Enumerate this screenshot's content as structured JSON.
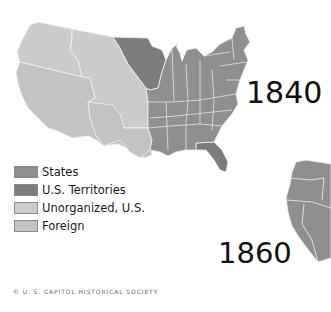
{
  "maps": [
    {
      "year_label": "1840"
    },
    {
      "year_label": "1860"
    }
  ],
  "legend": {
    "items": [
      {
        "label": "States",
        "color": "#8f8f8f"
      },
      {
        "label": "U.S. Territories",
        "color": "#7c7c7c"
      },
      {
        "label": "Unorganized, U.S.",
        "color": "#cbcbcb"
      },
      {
        "label": "Foreign",
        "color": "#c3c3c3"
      }
    ]
  },
  "colors": {
    "states": "#8f8f8f",
    "territories": "#7c7c7c",
    "unorganized": "#cbcbcb",
    "foreign": "#c3c3c3",
    "borders": "#f2f2f2"
  },
  "footer": {
    "copyright": "© U. S. CAPITOL HISTORICAL SOCIETY"
  }
}
